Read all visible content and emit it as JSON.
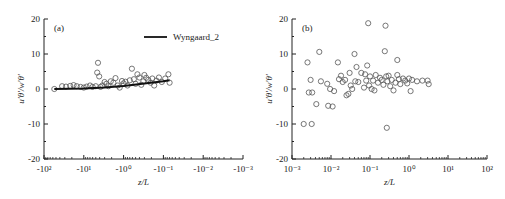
{
  "chart_data": [
    {
      "type": "scatter",
      "panel_label": "(a)",
      "xlabel": "z/L",
      "ylabel": "u'θ'/w'θ'",
      "xscale": "log (negative)",
      "xlim": [
        -100,
        -0.001
      ],
      "ylim": [
        -20,
        20
      ],
      "x_tick_labels": [
        "-10²",
        "-10¹",
        "-10⁰",
        "-10⁻¹",
        "-10⁻²",
        "-10⁻³"
      ],
      "y_tick_labels": [
        "20",
        "10",
        "0",
        "-10",
        "-20"
      ],
      "legend": [
        {
          "name": "Wyngaard_2",
          "style": "solid black line"
        }
      ],
      "legend_position": "upper right",
      "grid": false,
      "series": [
        {
          "name": "observations",
          "marker": "open circle",
          "points": [
            [
              -55,
              0.0
            ],
            [
              -35,
              0.8
            ],
            [
              -28,
              0.7
            ],
            [
              -22,
              0.9
            ],
            [
              -18,
              1.1
            ],
            [
              -15,
              0.8
            ],
            [
              -12,
              0.6
            ],
            [
              -10,
              0.4
            ],
            [
              -8.5,
              0.7
            ],
            [
              -7,
              1.0
            ],
            [
              -6,
              0.6
            ],
            [
              -5,
              0.8
            ],
            [
              -4.6,
              4.7
            ],
            [
              -4.4,
              7.5
            ],
            [
              -4.1,
              3.6
            ],
            [
              -3.8,
              0.6
            ],
            [
              -3.4,
              1.0
            ],
            [
              -3.0,
              2.0
            ],
            [
              -2.7,
              1.5
            ],
            [
              -2.4,
              0.8
            ],
            [
              -2.1,
              2.2
            ],
            [
              -1.8,
              1.8
            ],
            [
              -1.6,
              3.1
            ],
            [
              -1.4,
              1.0
            ],
            [
              -1.25,
              0.4
            ],
            [
              -1.1,
              2.3
            ],
            [
              -1.0,
              1.6
            ],
            [
              -0.9,
              2.1
            ],
            [
              -0.8,
              1.0
            ],
            [
              -0.7,
              2.5
            ],
            [
              -0.62,
              5.8
            ],
            [
              -0.55,
              2.8
            ],
            [
              -0.5,
              1.5
            ],
            [
              -0.45,
              4.2
            ],
            [
              -0.4,
              3.3
            ],
            [
              -0.36,
              1.2
            ],
            [
              -0.32,
              2.2
            ],
            [
              -0.3,
              4.0
            ],
            [
              -0.27,
              3.2
            ],
            [
              -0.24,
              2.6
            ],
            [
              -0.21,
              1.8
            ],
            [
              -0.19,
              3.0
            ],
            [
              -0.17,
              1.0
            ],
            [
              -0.15,
              2.4
            ],
            [
              -0.13,
              3.3
            ],
            [
              -0.11,
              2.0
            ],
            [
              -0.09,
              3.0
            ],
            [
              -0.075,
              4.2
            ],
            [
              -0.07,
              1.8
            ]
          ]
        },
        {
          "name": "Wyngaard_2",
          "type": "line",
          "points": [
            [
              -55,
              0.0
            ],
            [
              -10,
              0.1
            ],
            [
              -3,
              0.4
            ],
            [
              -1,
              0.9
            ],
            [
              -0.3,
              1.6
            ],
            [
              -0.1,
              2.2
            ],
            [
              -0.07,
              2.5
            ]
          ]
        }
      ]
    },
    {
      "type": "scatter",
      "panel_label": "(b)",
      "xlabel": "z/L",
      "ylabel": "u'θ'/w'θ'",
      "xscale": "log",
      "xlim": [
        0.001,
        100
      ],
      "ylim": [
        -20,
        20
      ],
      "x_tick_labels": [
        "10⁻³",
        "10⁻²",
        "10⁻¹",
        "10⁰",
        "10¹",
        "10²"
      ],
      "y_tick_labels": [
        "20",
        "10",
        "0",
        "-10",
        "-20"
      ],
      "grid": false,
      "series": [
        {
          "name": "observations",
          "marker": "open circle",
          "points": [
            [
              0.002,
              -10.0
            ],
            [
              0.0025,
              7.6
            ],
            [
              0.0027,
              -1.0
            ],
            [
              0.003,
              2.6
            ],
            [
              0.0032,
              -10.0
            ],
            [
              0.0033,
              -1.0
            ],
            [
              0.0042,
              -4.3
            ],
            [
              0.005,
              10.6
            ],
            [
              0.0055,
              2.2
            ],
            [
              0.008,
              1.5
            ],
            [
              0.0085,
              -4.8
            ],
            [
              0.0095,
              0.0
            ],
            [
              0.011,
              -5.0
            ],
            [
              0.012,
              -0.6
            ],
            [
              0.015,
              7.6
            ],
            [
              0.016,
              2.8
            ],
            [
              0.018,
              3.8
            ],
            [
              0.02,
              2.0
            ],
            [
              0.023,
              2.6
            ],
            [
              0.025,
              -1.8
            ],
            [
              0.028,
              -1.4
            ],
            [
              0.03,
              4.6
            ],
            [
              0.032,
              1.0
            ],
            [
              0.035,
              0.0
            ],
            [
              0.04,
              10.0
            ],
            [
              0.042,
              2.2
            ],
            [
              0.045,
              6.3
            ],
            [
              0.05,
              2.0
            ],
            [
              0.06,
              4.6
            ],
            [
              0.07,
              0.4
            ],
            [
              0.075,
              4.2
            ],
            [
              0.08,
              2.4
            ],
            [
              0.085,
              6.7
            ],
            [
              0.09,
              18.8
            ],
            [
              0.095,
              1.0
            ],
            [
              0.1,
              3.6
            ],
            [
              0.11,
              0.0
            ],
            [
              0.12,
              2.4
            ],
            [
              0.13,
              -0.4
            ],
            [
              0.14,
              4.0
            ],
            [
              0.16,
              1.8
            ],
            [
              0.18,
              3.2
            ],
            [
              0.2,
              2.6
            ],
            [
              0.22,
              1.2
            ],
            [
              0.24,
              10.8
            ],
            [
              0.25,
              18.1
            ],
            [
              0.26,
              3.6
            ],
            [
              0.27,
              -11.1
            ],
            [
              0.28,
              2.2
            ],
            [
              0.3,
              3.8
            ],
            [
              0.33,
              0.8
            ],
            [
              0.36,
              2.6
            ],
            [
              0.4,
              -0.4
            ],
            [
              0.45,
              1.8
            ],
            [
              0.5,
              8.3
            ],
            [
              0.5,
              4.0
            ],
            [
              0.55,
              2.8
            ],
            [
              0.6,
              1.4
            ],
            [
              0.7,
              3.0
            ],
            [
              0.8,
              2.4
            ],
            [
              0.9,
              1.6
            ],
            [
              1.0,
              3.0
            ],
            [
              1.1,
              -0.6
            ],
            [
              1.2,
              2.6
            ],
            [
              1.6,
              2.2
            ],
            [
              2.2,
              2.4
            ],
            [
              3.0,
              2.4
            ],
            [
              3.2,
              1.4
            ]
          ]
        }
      ]
    }
  ],
  "panels": {
    "a": {
      "label": "(a)",
      "xlabel": "z/L",
      "ylabel": "u'θ'/w'θ'",
      "legend_label": "Wyngaard_2"
    },
    "b": {
      "label": "(b)",
      "xlabel": "z/L",
      "ylabel": "u'θ'/w'θ'"
    }
  },
  "colors": {
    "axis": "#222222",
    "marker": "#555555",
    "line": "#111111",
    "background": "#ffffff"
  }
}
